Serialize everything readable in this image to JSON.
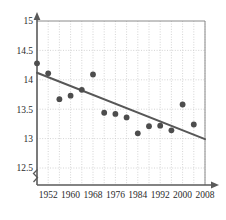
{
  "chart_data": {
    "type": "scatter",
    "title": "",
    "subtitle": "",
    "xlabel": "",
    "ylabel": "",
    "xlim": [
      1948,
      2008
    ],
    "ylim": [
      12.5,
      15
    ],
    "y_axis_break": true,
    "y_axis_break_symbol": "zigzag",
    "grid": true,
    "grid_style": "dotted",
    "legend": "none",
    "x_ticks": [
      1952,
      1960,
      1968,
      1976,
      1984,
      1992,
      2000,
      2008
    ],
    "x_tick_labels": [
      "1952",
      "1960",
      "1968",
      "1976",
      "1984",
      "1992",
      "2000",
      "2008"
    ],
    "x_gridline_step": 4,
    "y_ticks": [
      12.5,
      13,
      13.5,
      14,
      14.5,
      15
    ],
    "y_tick_labels": [
      "12.5",
      "13",
      "13.5",
      "14",
      "14.5",
      "15"
    ],
    "x": [
      1948,
      1952,
      1956,
      1960,
      1964,
      1968,
      1972,
      1976,
      1980,
      1984,
      1988,
      1992,
      1996,
      2000,
      2004
    ],
    "values": [
      14.28,
      14.11,
      13.67,
      13.73,
      13.83,
      14.09,
      13.44,
      13.42,
      13.36,
      13.09,
      13.21,
      13.22,
      13.14,
      13.58,
      13.24
    ],
    "series": [
      {
        "name": "observations",
        "type": "scatter",
        "marker": "circle",
        "color": "#4d4d4d",
        "x": [
          1948,
          1952,
          1956,
          1960,
          1964,
          1968,
          1972,
          1976,
          1980,
          1984,
          1988,
          1992,
          1996,
          2000,
          2004
        ],
        "values": [
          14.28,
          14.11,
          13.67,
          13.73,
          13.83,
          14.09,
          13.44,
          13.42,
          13.36,
          13.09,
          13.21,
          13.22,
          13.14,
          13.58,
          13.24
        ]
      },
      {
        "name": "trend-line",
        "type": "line",
        "color": "#575757",
        "x": [
          1948,
          2008
        ],
        "values": [
          14.12,
          12.99
        ]
      }
    ],
    "colors": {
      "marker": "#4d4d4d",
      "trend_line": "#575757",
      "axis": "#5a5a5a",
      "grid": "#c9c9c9",
      "text": "#2b2b2b",
      "background": "#ffffff"
    },
    "annotations": []
  },
  "axes": {
    "y_axis_name": "y-axis",
    "x_axis_name": "x-axis",
    "y_break_marker": "axis-break"
  }
}
